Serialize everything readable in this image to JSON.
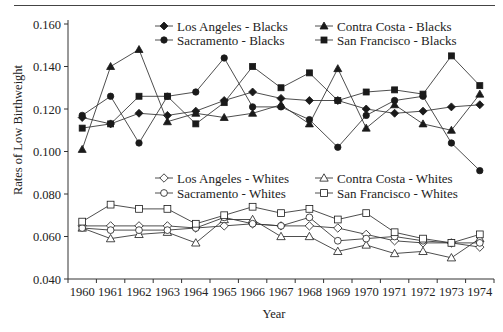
{
  "chart_data": {
    "type": "line",
    "title": "",
    "xlabel": "Year",
    "ylabel": "Rates of Low Birthweight",
    "ylim": [
      0.04,
      0.16
    ],
    "yticks": [
      "0.040",
      "0.060",
      "0.080",
      "0.100",
      "0.120",
      "0.140",
      "0.160"
    ],
    "x": [
      1960,
      1961,
      1962,
      1963,
      1964,
      1965,
      1966,
      1967,
      1968,
      1969,
      1970,
      1971,
      1972,
      1973,
      1974
    ],
    "grid": false,
    "legend_position": "two legend blocks inside plot (top for Blacks, middle for Whites)",
    "series": [
      {
        "name": "Los Angeles - Blacks",
        "marker": "diamond",
        "filled": true,
        "group": "blacks",
        "values": [
          0.116,
          0.113,
          0.118,
          0.117,
          0.119,
          0.124,
          0.128,
          0.125,
          0.124,
          0.124,
          0.12,
          0.118,
          0.119,
          0.121,
          0.122
        ]
      },
      {
        "name": "Contra Costa - Blacks",
        "marker": "triangle",
        "filled": true,
        "group": "blacks",
        "values": [
          0.101,
          0.14,
          0.148,
          0.114,
          0.118,
          0.116,
          0.118,
          0.122,
          0.113,
          0.139,
          0.111,
          0.122,
          0.113,
          0.11,
          0.127
        ]
      },
      {
        "name": "Sacramento - Blacks",
        "marker": "circle",
        "filled": true,
        "group": "blacks",
        "values": [
          0.117,
          0.126,
          0.104,
          0.126,
          0.128,
          0.144,
          0.121,
          0.121,
          0.115,
          0.102,
          0.117,
          0.124,
          0.126,
          0.104,
          0.091
        ]
      },
      {
        "name": "San Francisco - Blacks",
        "marker": "square",
        "filled": true,
        "group": "blacks",
        "values": [
          0.111,
          0.113,
          0.126,
          0.126,
          0.113,
          0.123,
          0.14,
          0.13,
          0.137,
          0.124,
          0.128,
          0.129,
          0.127,
          0.145,
          0.131
        ]
      },
      {
        "name": "Los Angeles - Whites",
        "marker": "diamond",
        "filled": false,
        "group": "whites",
        "values": [
          0.065,
          0.065,
          0.065,
          0.065,
          0.064,
          0.065,
          0.066,
          0.065,
          0.065,
          0.064,
          0.061,
          0.058,
          0.057,
          0.057,
          0.055
        ]
      },
      {
        "name": "Contra Costa - Whites",
        "marker": "triangle",
        "filled": false,
        "group": "whites",
        "values": [
          0.064,
          0.059,
          0.061,
          0.062,
          0.057,
          0.068,
          0.068,
          0.06,
          0.06,
          0.053,
          0.056,
          0.052,
          0.053,
          0.05,
          0.059
        ]
      },
      {
        "name": "Sacramento - Whites",
        "marker": "circle",
        "filled": false,
        "group": "whites",
        "values": [
          0.064,
          0.063,
          0.063,
          0.063,
          0.064,
          0.069,
          0.066,
          0.065,
          0.069,
          0.058,
          0.059,
          0.06,
          0.058,
          0.057,
          0.057
        ]
      },
      {
        "name": "San Francisco - Whites",
        "marker": "square",
        "filled": false,
        "group": "whites",
        "values": [
          0.067,
          0.075,
          0.073,
          0.073,
          0.066,
          0.07,
          0.074,
          0.071,
          0.073,
          0.068,
          0.071,
          0.062,
          0.059,
          0.057,
          0.061
        ]
      }
    ]
  },
  "legends": {
    "blacks": [
      {
        "label": "Los Angeles - Blacks",
        "marker": "diamond",
        "filled": true
      },
      {
        "label": "Contra Costa - Blacks",
        "marker": "triangle",
        "filled": true
      },
      {
        "label": "Sacramento - Blacks",
        "marker": "circle",
        "filled": true
      },
      {
        "label": "San Francisco - Blacks",
        "marker": "square",
        "filled": true
      }
    ],
    "whites": [
      {
        "label": "Los Angeles - Whites",
        "marker": "diamond",
        "filled": false
      },
      {
        "label": "Contra Costa - Whites",
        "marker": "triangle",
        "filled": false
      },
      {
        "label": "Sacramento - Whites",
        "marker": "circle",
        "filled": false
      },
      {
        "label": "San Francisco - Whites",
        "marker": "square",
        "filled": false
      }
    ]
  },
  "colors": {
    "line": "#3a3a3a",
    "marker": "#1a1a1a",
    "axis": "#333333",
    "text": "#222222",
    "background": "#ffffff"
  }
}
